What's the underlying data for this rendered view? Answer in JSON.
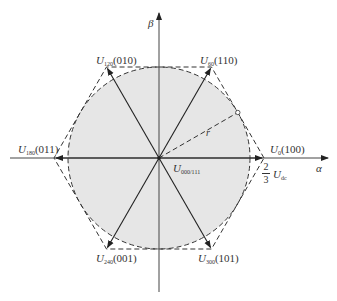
{
  "figure": {
    "axes": {
      "alpha_label": "α",
      "beta_label": "β"
    },
    "vectors": [
      {
        "name": "U",
        "sub": "0",
        "state": "(100)",
        "angle_deg": 0
      },
      {
        "name": "U",
        "sub": "60",
        "state": "(110)",
        "angle_deg": 60
      },
      {
        "name": "U",
        "sub": "120",
        "state": "(010)",
        "angle_deg": 120
      },
      {
        "name": "U",
        "sub": "180",
        "state": "(011)",
        "angle_deg": 180
      },
      {
        "name": "U",
        "sub": "240",
        "state": "(001)",
        "angle_deg": 240
      },
      {
        "name": "U",
        "sub": "300",
        "state": "(101)",
        "angle_deg": 300
      }
    ],
    "zero_vector": {
      "name": "U",
      "sub": "000/111"
    },
    "radius_label": "r",
    "magnitude": {
      "numerator": "2",
      "denominator": "3",
      "symbol": "U",
      "sub": "dc"
    },
    "colors": {
      "circle_fill": "#e6e6e6",
      "line": "#333333",
      "dashed": "#333333",
      "background": "#ffffff"
    }
  }
}
